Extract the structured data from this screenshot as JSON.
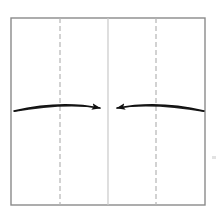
{
  "diagram": {
    "title": "Origami fold step: fold both side edges to the vertical center line",
    "type": "origami-fold-instruction",
    "background_color": "#ffffff",
    "canvas": {
      "width": 221,
      "height": 215
    },
    "paper": {
      "label": "square paper sheet",
      "shape": "square",
      "x": 11,
      "y": 18,
      "width": 194,
      "height": 187,
      "stroke_color": "#8a8a8a",
      "stroke_width": 1.4,
      "fill_color": "#ffffff"
    },
    "center_line": {
      "label": "vertical center crease",
      "style": "solid",
      "x": 108,
      "y_top": 18,
      "y_bottom": 205,
      "stroke_color": "#c9c9c9",
      "stroke_width": 1.2
    },
    "crease_lines": [
      {
        "label": "left quarter crease",
        "style": "dashed",
        "x": 60,
        "y_top": 18,
        "y_bottom": 205,
        "stroke_color": "#b5b5b5",
        "stroke_width": 1.2,
        "dash_pattern": "5 3"
      },
      {
        "label": "right quarter crease",
        "style": "dashed",
        "x": 156,
        "y_top": 18,
        "y_bottom": 205,
        "stroke_color": "#b5b5b5",
        "stroke_width": 1.2,
        "dash_pattern": "5 3"
      }
    ],
    "arrows": [
      {
        "label": "left fold arrow",
        "direction": "left-to-center",
        "start_x": 14,
        "start_y": 111,
        "end_x": 105,
        "end_y": 108,
        "arc_peak_x": 60,
        "arc_peak_y": 100,
        "stroke_color": "#111111",
        "head_style": "solid-triangle"
      },
      {
        "label": "right fold arrow",
        "direction": "right-to-center",
        "start_x": 204,
        "start_y": 111,
        "end_x": 112,
        "end_y": 108,
        "arc_peak_x": 158,
        "arc_peak_y": 100,
        "stroke_color": "#111111",
        "head_style": "solid-triangle"
      }
    ],
    "artifact": {
      "label": "faint scan speck",
      "x": 212,
      "y": 156,
      "width": 4,
      "height": 3,
      "color": "#e2e2e2"
    }
  }
}
